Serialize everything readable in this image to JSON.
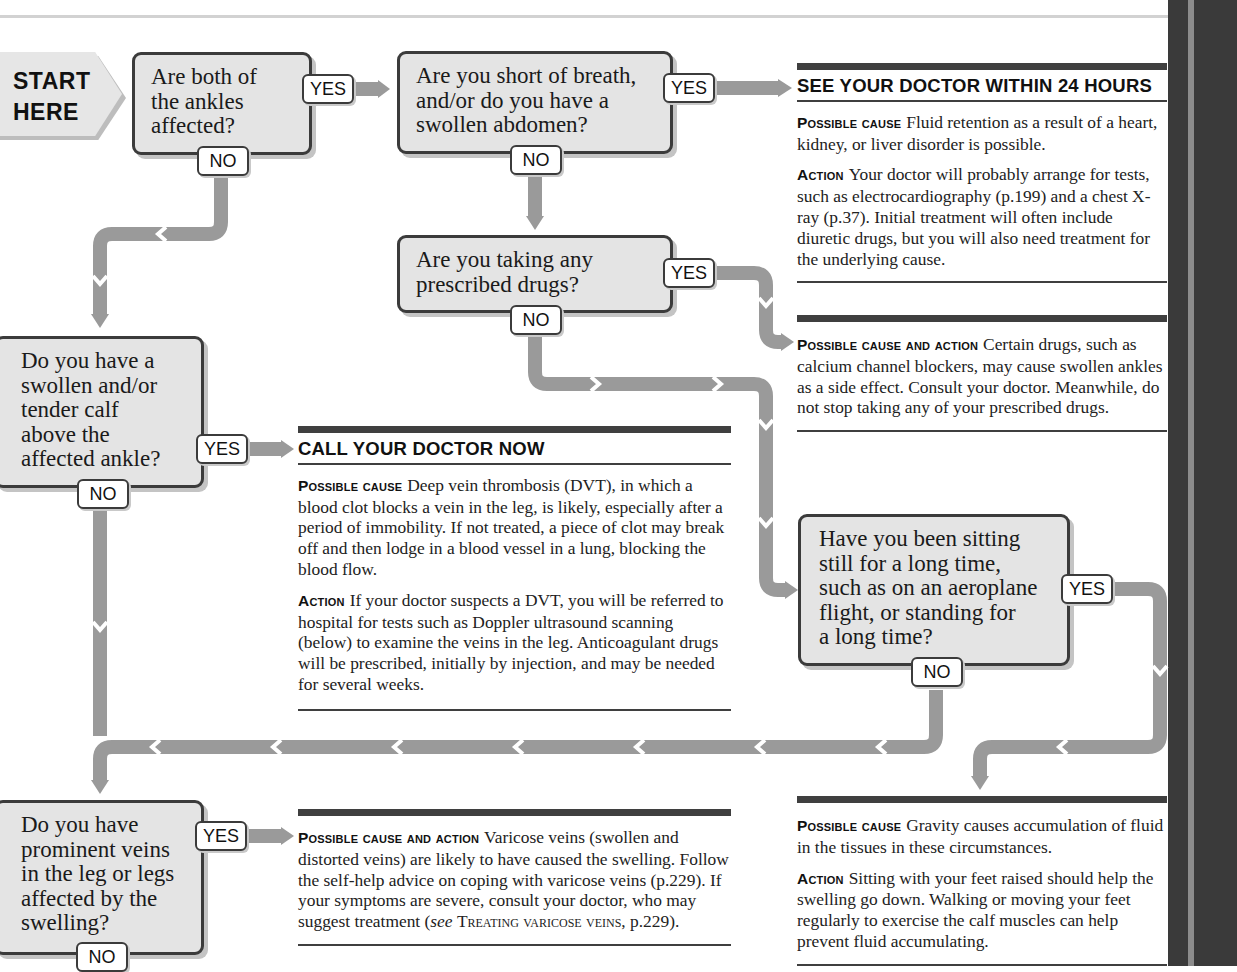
{
  "start": {
    "line1": "START",
    "line2": "HERE"
  },
  "labels": {
    "yes": "YES",
    "no": "NO"
  },
  "colors": {
    "box_fill": "#e4e4e4",
    "box_border": "#3b3b3b",
    "connector": "#9a9a9a",
    "rule": "#3f3f3f",
    "spine": "#3a3a3a"
  },
  "questions": [
    {
      "id": "q1",
      "text": "Are both of\nthe ankles\naffected?"
    },
    {
      "id": "q2",
      "text": "Are you short of breath,\nand/or do you have a\nswollen abdomen?"
    },
    {
      "id": "q3",
      "text": "Are you taking any\nprescribed drugs?"
    },
    {
      "id": "q4",
      "text": "Do you have a\nswollen and/or\ntender calf\nabove the\naffected ankle?"
    },
    {
      "id": "q5",
      "text": "Have you been sitting\nstill for a long time,\nsuch as on an aeroplane\nflight, or standing for\na long time?"
    },
    {
      "id": "q6",
      "text": "Do you have\nprominent veins\nin the leg or legs\naffected by the\nswelling?"
    }
  ],
  "outcomes": {
    "see_doctor_24h": {
      "heading": "SEE YOUR DOCTOR WITHIN 24 HOURS",
      "cause_label": "Possible cause",
      "cause_text": "Fluid retention as a result of a heart, kidney, or liver disorder is possible.",
      "action_label": "Action",
      "action_text": "Your doctor will probably arrange for tests, such as electrocardiography (p.199) and a chest X-ray (p.37). Initial treatment will often include diuretic drugs, but you will also need treatment for the underlying cause."
    },
    "drugs": {
      "label": "Possible cause and action",
      "text": "Certain drugs, such as calcium channel blockers, may cause swollen ankles as a side effect. Consult your doctor. Meanwhile, do not stop taking any of your prescribed drugs."
    },
    "call_doctor_now": {
      "heading": "CALL YOUR DOCTOR NOW",
      "cause_label": "Possible cause",
      "cause_text": "Deep vein thrombosis (DVT), in which a blood clot blocks a vein in the leg, is likely, especially after a period of immobility. If not treated, a piece of clot may break off and then lodge in a blood vessel in a lung, blocking the blood flow.",
      "action_label": "Action",
      "action_text": "If your doctor suspects a DVT, you will be referred to hospital for tests such as Doppler ultrasound scanning (below) to examine the veins in the leg. Anticoagulant drugs will be prescribed, initially by injection, and may be needed for several weeks."
    },
    "varicose": {
      "label": "Possible cause and action",
      "text": "Varicose veins (swollen and distorted veins) are likely to have caused the swelling. Follow the self-help advice on coping with varicose veins (p.229). If your symptoms are severe, consult your doctor, who may suggest treatment (",
      "see": "see",
      "ref": "Treating varicose veins",
      "tail": ", p.229)."
    },
    "gravity": {
      "cause_label": "Possible cause",
      "cause_text": "Gravity causes accumulation of fluid in the tissues in these circumstances.",
      "action_label": "Action",
      "action_text": "Sitting with your feet raised should help the swelling go down. Walking or moving your feet regularly to exercise the calf muscles can help prevent fluid accumulating."
    }
  }
}
